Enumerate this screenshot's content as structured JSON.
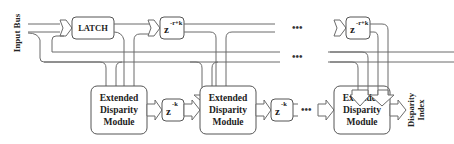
{
  "diagram": {
    "input_label": "Input Bus",
    "output_label_line1": "Disparity",
    "output_label_line2": "Index",
    "latch_label": "LATCH",
    "delay_top_1": {
      "base": "z",
      "exp": "-r+k"
    },
    "delay_top_2": {
      "base": "z",
      "exp": "-r+k"
    },
    "delay_bottom_1": {
      "base": "z",
      "exp": "-k"
    },
    "delay_bottom_2": {
      "base": "z",
      "exp": "-k"
    },
    "ellipsis": "•••",
    "modules": [
      {
        "line1": "Extended",
        "line2": "Disparity",
        "line3": "Module"
      },
      {
        "line1": "Extended",
        "line2": "Disparity",
        "line3": "Module"
      },
      {
        "line1": "Extended",
        "line2": "Disparity",
        "line3": "Module"
      }
    ],
    "colors": {
      "stroke": "#555555",
      "text": "#222222",
      "background": "#ffffff"
    }
  }
}
